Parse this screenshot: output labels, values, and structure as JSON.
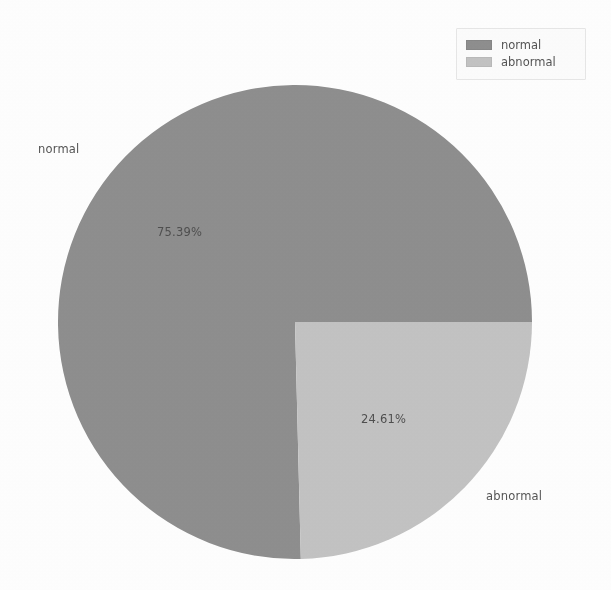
{
  "chart_data": {
    "type": "pie",
    "title": "",
    "categories": [
      "normal",
      "abnormal"
    ],
    "values": [
      75.39,
      24.61
    ],
    "value_unit": "%",
    "labels": [
      "normal",
      "abnormal"
    ],
    "autopct_labels": [
      "75.39%",
      "24.61%"
    ],
    "colors": [
      "#8f8f8f",
      "#c4c4c4"
    ],
    "startangle": 0,
    "counterclock": true,
    "legend": {
      "position": "upper-right",
      "entries": [
        {
          "label": "normal",
          "color": "#8f8f8f"
        },
        {
          "label": "abnormal",
          "color": "#c4c4c4"
        }
      ]
    },
    "slices": [
      {
        "name": "normal",
        "percent": 75.39,
        "percent_label": "75.39%",
        "color": "#8f8f8f",
        "start_angle_deg": 0,
        "end_angle_deg": 271.404
      },
      {
        "name": "abnormal",
        "percent": 24.61,
        "percent_label": "24.61%",
        "color": "#c4c4c4",
        "start_angle_deg": 271.404,
        "end_angle_deg": 360
      }
    ],
    "grid": false,
    "axis_visible": false
  },
  "figure": {
    "background": "#ffffff",
    "pie": {
      "center_x": 237,
      "center_y": 237,
      "radius": 237
    }
  },
  "labels": {
    "normal_name": "normal",
    "abnormal_name": "abnormal",
    "normal_pct": "75.39%",
    "abnormal_pct": "24.61%"
  },
  "legend": {
    "normal_label": "normal",
    "abnormal_label": "abnormal"
  }
}
